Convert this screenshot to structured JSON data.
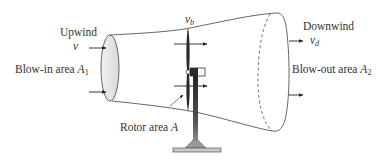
{
  "diagram": {
    "labels": {
      "upwind": "Upwind",
      "upwind_speed": "v",
      "blow_in_text": "Blow-in area ",
      "blow_in_symbol": "A",
      "blow_in_sub": "1",
      "rotor_speed": "v",
      "rotor_speed_sub": "b",
      "rotor_area_text": "Rotor area ",
      "rotor_area_symbol": "A",
      "downwind": "Downwind",
      "downwind_speed": "v",
      "downwind_speed_sub": "d",
      "blow_out_text": "Blow-out area ",
      "blow_out_symbol": "A",
      "blow_out_sub": "2"
    },
    "colors": {
      "line": "#555555",
      "fill_ellipse": "#e6e6e6",
      "blade": "#2a2a2a",
      "text": "#333333"
    }
  }
}
